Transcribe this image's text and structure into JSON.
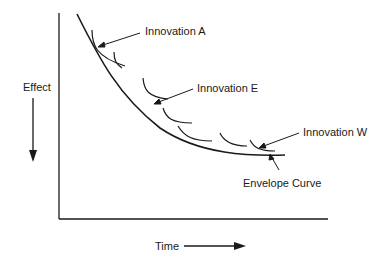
{
  "diagram": {
    "y_axis_label": "Effect",
    "x_axis_label": "Time",
    "annotations": [
      {
        "id": "innovation-a",
        "text": "Innovation A"
      },
      {
        "id": "innovation-e",
        "text": "Innovation E"
      },
      {
        "id": "innovation-w",
        "text": "Innovation W"
      },
      {
        "id": "envelope-curve",
        "text": "Envelope Curve"
      }
    ],
    "colors": {
      "line": "#1a1a1a",
      "background": "#ffffff"
    }
  }
}
